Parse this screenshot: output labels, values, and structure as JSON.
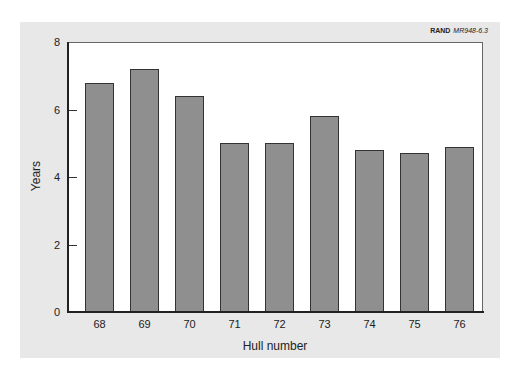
{
  "chart_data": {
    "type": "bar",
    "title": "",
    "source_label": {
      "org": "RAND",
      "id": "MR948-6.3"
    },
    "xlabel": "Hull number",
    "ylabel": "Years",
    "categories": [
      "68",
      "69",
      "70",
      "71",
      "72",
      "73",
      "74",
      "75",
      "76"
    ],
    "values": [
      6.8,
      7.2,
      6.4,
      5.0,
      5.0,
      5.8,
      4.8,
      4.7,
      4.9
    ],
    "ylim": [
      0,
      8
    ],
    "yticks": [
      0,
      2,
      4,
      6,
      8
    ],
    "grid": false,
    "legend": null,
    "colors": {
      "bar_fill": "#8f8f8f",
      "bar_border": "#333333",
      "panel_bg": "#e8e8e8",
      "plot_bg": "#ffffff"
    }
  }
}
